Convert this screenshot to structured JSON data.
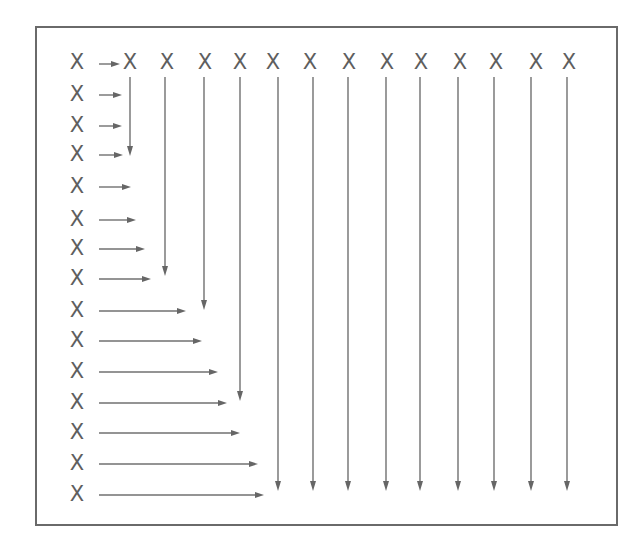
{
  "diagram": {
    "title": "",
    "frame": {
      "x": 36,
      "y": 27,
      "width": 581,
      "height": 498
    },
    "colors": {
      "stroke": "#6a6a6a",
      "mark": "#5e5e5e",
      "arrow": "#707070"
    },
    "mark_label": "X",
    "top_row": {
      "y": 62,
      "marks_x": [
        77,
        130,
        167,
        205,
        240,
        273,
        310,
        349,
        387,
        421,
        460,
        496,
        536,
        569
      ],
      "arrow": {
        "x1": 99,
        "x2": 120,
        "y": 64
      }
    },
    "left_column": {
      "x": 77,
      "rows": [
        {
          "y": 94,
          "arrow_x1": 99,
          "arrow_x2": 122
        },
        {
          "y": 125,
          "arrow_x1": 99,
          "arrow_x2": 122
        },
        {
          "y": 154,
          "arrow_x1": 99,
          "arrow_x2": 123
        },
        {
          "y": 186,
          "arrow_x1": 99,
          "arrow_x2": 131
        },
        {
          "y": 219,
          "arrow_x1": 99,
          "arrow_x2": 136
        },
        {
          "y": 248,
          "arrow_x1": 99,
          "arrow_x2": 145
        },
        {
          "y": 278,
          "arrow_x1": 99,
          "arrow_x2": 151
        },
        {
          "y": 310,
          "arrow_x1": 99,
          "arrow_x2": 186
        },
        {
          "y": 340,
          "arrow_x1": 99,
          "arrow_x2": 202
        },
        {
          "y": 371,
          "arrow_x1": 99,
          "arrow_x2": 218
        },
        {
          "y": 402,
          "arrow_x1": 99,
          "arrow_x2": 227
        },
        {
          "y": 432,
          "arrow_x1": 99,
          "arrow_x2": 240
        },
        {
          "y": 463,
          "arrow_x1": 99,
          "arrow_x2": 258
        },
        {
          "y": 494,
          "arrow_x1": 99,
          "arrow_x2": 264
        }
      ]
    },
    "vertical_arrows": [
      {
        "x": 130,
        "y1": 77,
        "y2": 156
      },
      {
        "x": 165,
        "y1": 77,
        "y2": 276
      },
      {
        "x": 204,
        "y1": 77,
        "y2": 310
      },
      {
        "x": 240,
        "y1": 77,
        "y2": 401
      },
      {
        "x": 278,
        "y1": 77,
        "y2": 491
      },
      {
        "x": 313,
        "y1": 77,
        "y2": 491
      },
      {
        "x": 348,
        "y1": 77,
        "y2": 491
      },
      {
        "x": 386,
        "y1": 77,
        "y2": 491
      },
      {
        "x": 420,
        "y1": 77,
        "y2": 491
      },
      {
        "x": 458,
        "y1": 77,
        "y2": 491
      },
      {
        "x": 494,
        "y1": 77,
        "y2": 491
      },
      {
        "x": 531,
        "y1": 77,
        "y2": 491
      },
      {
        "x": 567,
        "y1": 77,
        "y2": 491
      }
    ]
  }
}
